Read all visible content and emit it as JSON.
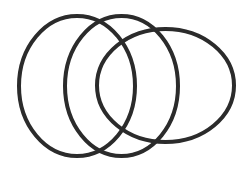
{
  "diagram": {
    "type": "overlapping-ellipses",
    "background": "#ffffff",
    "stroke_color": "#2b2b2b",
    "stroke_width": 4,
    "ellipses": [
      {
        "name": "left",
        "cx": 77,
        "cy": 86,
        "rx": 58,
        "ry": 70
      },
      {
        "name": "middle",
        "cx": 121.5,
        "cy": 86,
        "rx": 56.5,
        "ry": 70
      },
      {
        "name": "right",
        "cx": 165.5,
        "cy": 85.5,
        "rx": 68.5,
        "ry": 56.5
      }
    ]
  }
}
